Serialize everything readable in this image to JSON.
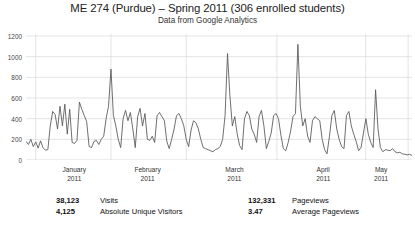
{
  "header": {
    "title": "ME 274 (Purdue) – Spring 2011 (306 enrolled students)",
    "subtitle": "Data from Google Analytics"
  },
  "stats": {
    "columns": [
      [
        {
          "value": "38,123",
          "label": "Visits"
        },
        {
          "value": "4,125",
          "label": "Absolute Unique Visitors"
        }
      ],
      [
        {
          "value": "132,331",
          "label": "Pageviews"
        },
        {
          "value": "3.47",
          "label": "Average Pageviews"
        }
      ]
    ]
  },
  "chart_data": {
    "type": "line",
    "title": "ME 274 (Purdue) – Spring 2011 (306 enrolled students)",
    "subtitle": "Data from Google Analytics",
    "xlabel": "",
    "ylabel": "",
    "ylim": [
      0,
      1200
    ],
    "yticks": [
      0,
      200,
      400,
      600,
      800,
      1000,
      1200
    ],
    "ytick_labels": [
      "0",
      "200",
      "400",
      "600",
      "800",
      "1000",
      "1200"
    ],
    "grid": true,
    "legend": null,
    "line_color": "#555555",
    "grid_color": "#d8d8d8",
    "x_tick_labels": [
      {
        "month": "January",
        "year": "2011"
      },
      {
        "month": "February",
        "year": "2011"
      },
      {
        "month": "March",
        "year": "2011"
      },
      {
        "month": "April",
        "year": "2011"
      },
      {
        "month": "May",
        "year": "2011"
      }
    ],
    "x_month_centers_pct": [
      12.5,
      31.5,
      54.0,
      77.0,
      92.0
    ],
    "x_month_boundaries_pct": [
      2.5,
      22.0,
      41.5,
      65.0,
      88.0,
      99.0
    ],
    "series_name": "Visits per day",
    "values": [
      180,
      150,
      200,
      130,
      175,
      115,
      185,
      120,
      95,
      100,
      330,
      470,
      440,
      300,
      520,
      330,
      540,
      250,
      490,
      170,
      160,
      190,
      560,
      490,
      430,
      370,
      130,
      120,
      180,
      190,
      150,
      200,
      230,
      400,
      520,
      880,
      430,
      330,
      200,
      120,
      400,
      480,
      380,
      460,
      300,
      120,
      420,
      500,
      330,
      450,
      200,
      190,
      230,
      170,
      430,
      460,
      420,
      380,
      180,
      110,
      200,
      300,
      430,
      450,
      400,
      330,
      200,
      130,
      290,
      380,
      360,
      300,
      200,
      120,
      110,
      100,
      90,
      80,
      100,
      110,
      130,
      200,
      430,
      1030,
      620,
      330,
      420,
      250,
      140,
      100,
      400,
      470,
      430,
      300,
      250,
      170,
      420,
      480,
      330,
      110,
      180,
      260,
      430,
      450,
      400,
      240,
      110,
      90,
      170,
      280,
      420,
      450,
      1120,
      520,
      330,
      400,
      230,
      170,
      380,
      420,
      400,
      380,
      200,
      100,
      60,
      230,
      430,
      480,
      300,
      200,
      130,
      110,
      430,
      470,
      330,
      250,
      180,
      90,
      120,
      260,
      400,
      250,
      170,
      120,
      680,
      300,
      120,
      80,
      100,
      95,
      90,
      110,
      80,
      70,
      75,
      60,
      55,
      50,
      55,
      45
    ]
  }
}
